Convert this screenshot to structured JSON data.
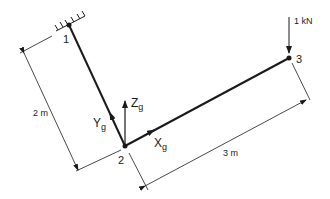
{
  "diagram": {
    "type": "structural-frame",
    "nodes": [
      {
        "id": "1",
        "label": "1",
        "x": 69,
        "y": 25,
        "support": "fixed"
      },
      {
        "id": "2",
        "label": "2",
        "x": 125,
        "y": 146
      },
      {
        "id": "3",
        "label": "3",
        "x": 289,
        "y": 58
      }
    ],
    "members": [
      {
        "from": "1",
        "to": "2"
      },
      {
        "from": "2",
        "to": "3"
      }
    ],
    "load": {
      "node": "3",
      "label": "1 kN",
      "direction": "down"
    },
    "axes": {
      "x_label": "X",
      "x_sub": "g",
      "y_label": "Y",
      "y_sub": "g",
      "z_label": "Z",
      "z_sub": "g"
    },
    "dimensions": [
      {
        "label": "2 m",
        "between": [
          "1",
          "2"
        ]
      },
      {
        "label": "3 m",
        "between": [
          "2",
          "3"
        ]
      }
    ],
    "colors": {
      "line": "#1a1a1a",
      "background": "#ffffff"
    }
  }
}
